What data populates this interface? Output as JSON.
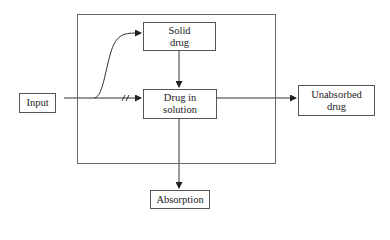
{
  "diagram": {
    "type": "flowchart",
    "nodes": {
      "input": {
        "label": "Input"
      },
      "solid_drug": {
        "label": "Solid drug",
        "lines": [
          "Solid",
          "drug"
        ]
      },
      "drug_in_solution": {
        "label": "Drug in solution",
        "lines": [
          "Drug in",
          "solution"
        ]
      },
      "unabsorbed_drug": {
        "label": "Unabsorbed drug",
        "lines": [
          "Unabsorbed",
          "drug"
        ]
      },
      "absorption": {
        "label": "Absorption"
      }
    },
    "edges": [
      {
        "from": "input",
        "to": "solid_drug",
        "style": "curved"
      },
      {
        "from": "input",
        "to": "drug_in_solution",
        "style": "straight",
        "marker": "break //"
      },
      {
        "from": "solid_drug",
        "to": "drug_in_solution",
        "style": "straight"
      },
      {
        "from": "drug_in_solution",
        "to": "unabsorbed_drug",
        "style": "straight"
      },
      {
        "from": "drug_in_solution",
        "to": "absorption",
        "style": "straight"
      }
    ],
    "colors": {
      "line": "#333333",
      "border": "#555555",
      "background": "#ffffff"
    }
  }
}
